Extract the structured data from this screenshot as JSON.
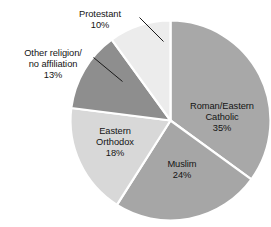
{
  "chart_data": {
    "type": "pie",
    "title": "",
    "subtitle": "",
    "xlabel": "",
    "ylabel": "",
    "legend_position": "none",
    "grid": false,
    "value_unit": "percent",
    "start_angle_deg": 0,
    "direction": "clockwise",
    "categories": [
      "Roman/Eastern Catholic",
      "Muslim",
      "Eastern Orthodox",
      "Other religion/no affiliation",
      "Protestant"
    ],
    "values": [
      35,
      24,
      18,
      13,
      10
    ],
    "slices": [
      {
        "id": "catholic",
        "label_lines": [
          "Roman/Eastern",
          "Catholic",
          "35%"
        ],
        "name": "Roman/Eastern Catholic",
        "value": 35,
        "value_text": "35%",
        "color": "#a8a8a8",
        "label_placement": "inside"
      },
      {
        "id": "muslim",
        "label_lines": [
          "Muslim",
          "24%"
        ],
        "name": "Muslim",
        "value": 24,
        "value_text": "24%",
        "color": "#a6a6a6",
        "label_placement": "inside"
      },
      {
        "id": "orthodox",
        "label_lines": [
          "Eastern",
          "Orthodox",
          "18%"
        ],
        "name": "Eastern Orthodox",
        "value": 18,
        "value_text": "18%",
        "color": "#d8d8d8",
        "label_placement": "inside"
      },
      {
        "id": "other",
        "label_lines": [
          "Other religion/",
          "no affiliation",
          "13%"
        ],
        "name": "Other religion/no affiliation",
        "value": 13,
        "value_text": "13%",
        "color": "#8e8e8e",
        "label_placement": "outside"
      },
      {
        "id": "protestant",
        "label_lines": [
          "Protestant",
          "10%"
        ],
        "name": "Protestant",
        "value": 10,
        "value_text": "10%",
        "color": "#ececec",
        "label_placement": "outside"
      }
    ]
  },
  "labels": {
    "catholic": {
      "line1": "Roman/Eastern",
      "line2": "Catholic",
      "line3": "35%"
    },
    "muslim": {
      "line1": "Muslim",
      "line2": "24%"
    },
    "orthodox": {
      "line1": "Eastern",
      "line2": "Orthodox",
      "line3": "18%"
    },
    "other": {
      "line1": "Other religion/",
      "line2": "no affiliation",
      "line3": "13%"
    },
    "protestant": {
      "line1": "Protestant",
      "line2": "10%"
    }
  },
  "style": {
    "background": "#ffffff",
    "text_color": "#141414",
    "slice_border": "#ffffff",
    "leader_line_color": "#1a1a1a"
  }
}
